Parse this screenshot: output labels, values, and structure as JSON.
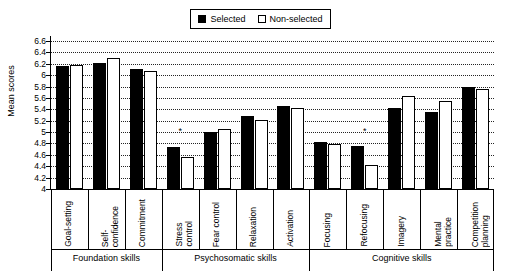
{
  "legend": {
    "items": [
      {
        "label": "Selected",
        "swatch": "filled-square",
        "color": "#000000"
      },
      {
        "label": "Non-selected",
        "swatch": "open-square",
        "color": "#ffffff"
      }
    ]
  },
  "chart_data": {
    "type": "bar",
    "title": "",
    "xlabel": "",
    "ylabel": "Mean scores",
    "ylim": [
      4,
      6.6
    ],
    "ytick_step": 0.2,
    "ytick_labels": [
      "4",
      "4.2",
      "4.4",
      "4.6",
      "4.8",
      "5",
      "5.2",
      "5.4",
      "5.6",
      "5.8",
      "6",
      "6.2",
      "6.4",
      "6.6"
    ],
    "grid": true,
    "legend_position": "top-center",
    "categories": [
      "Goal-setting",
      "Self-confidence",
      "Commitment",
      "Stress control",
      "Fear control",
      "Relaxation",
      "Activation",
      "Focusing",
      "Refocusing",
      "Imagery",
      "Mental practice",
      "Competition planning"
    ],
    "series": [
      {
        "name": "Selected",
        "values": [
          6.16,
          6.21,
          6.11,
          4.74,
          5.01,
          5.28,
          5.45,
          4.82,
          4.75,
          5.43,
          5.35,
          5.8
        ]
      },
      {
        "name": "Non-selected",
        "values": [
          6.18,
          6.3,
          6.08,
          4.56,
          5.06,
          5.22,
          5.42,
          4.79,
          4.43,
          5.63,
          5.55,
          5.76
        ]
      }
    ],
    "annotations": [
      {
        "text": "*",
        "category": "Stress control",
        "y": 5.02
      },
      {
        "text": "*",
        "category": "Refocusing",
        "y": 5.02
      }
    ],
    "group_bands": [
      {
        "label": "Foundation skills",
        "categories": [
          "Goal-setting",
          "Self-confidence",
          "Commitment"
        ]
      },
      {
        "label": "Psychosomatic skills",
        "categories": [
          "Stress control",
          "Fear control",
          "Relaxation",
          "Activation"
        ]
      },
      {
        "label": "Cognitive skills",
        "categories": [
          "Focusing",
          "Refocusing",
          "Imagery",
          "Mental practice",
          "Competition planning"
        ]
      }
    ]
  }
}
